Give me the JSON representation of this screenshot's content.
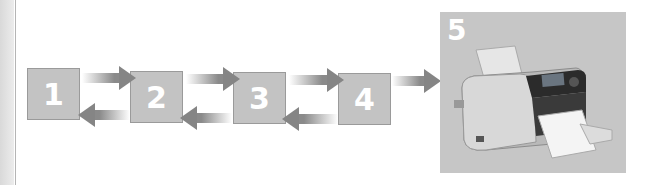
{
  "diagram": {
    "steps": [
      {
        "label": "1"
      },
      {
        "label": "2"
      },
      {
        "label": "3"
      },
      {
        "label": "4"
      },
      {
        "label": "5",
        "image": "photo-printer"
      }
    ],
    "connections": [
      {
        "from": "1",
        "to": "2",
        "direction": "bidirectional"
      },
      {
        "from": "2",
        "to": "3",
        "direction": "bidirectional"
      },
      {
        "from": "3",
        "to": "4",
        "direction": "bidirectional"
      },
      {
        "from": "4",
        "to": "5",
        "direction": "forward"
      }
    ],
    "colors": {
      "box": "#c3c3c3",
      "arrow": "#858585",
      "label": "#ffffff"
    }
  }
}
